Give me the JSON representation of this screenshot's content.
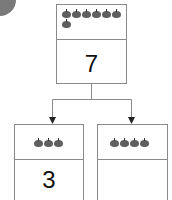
{
  "diagram": {
    "whole": {
      "apple_count": 7,
      "number": "7"
    },
    "parts": [
      {
        "apple_count": 3,
        "number": "3"
      },
      {
        "apple_count": 4,
        "number": ""
      }
    ],
    "colors": {
      "border": "#8a8a8a",
      "apple": "#5f5f5f",
      "corner_circle": "#7a7a7a"
    }
  }
}
